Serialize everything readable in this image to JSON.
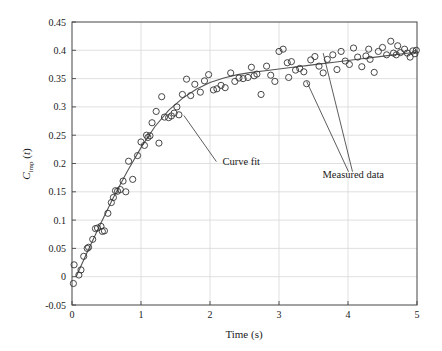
{
  "chart_data": {
    "type": "scatter",
    "title": "",
    "xlabel": "Time (s)",
    "ylabel": "C_imp(t)",
    "ylabel_base": "C",
    "ylabel_sub": "imp",
    "ylabel_arg": "(t)",
    "xlim": [
      0,
      5
    ],
    "ylim": [
      -0.05,
      0.45
    ],
    "xticks": [
      0,
      1,
      2,
      3,
      4,
      5
    ],
    "xtick_labels": [
      "0",
      "1",
      "2",
      "3",
      "4",
      "5"
    ],
    "yticks": [
      -0.05,
      0,
      0.05,
      0.1,
      0.15,
      0.2,
      0.25,
      0.3,
      0.35,
      0.4,
      0.45
    ],
    "ytick_labels": [
      "-0.05",
      "0",
      "0.05",
      "0.1",
      "0.15",
      "0.2",
      "0.25",
      "0.3",
      "0.35",
      "0.4",
      "0.45"
    ],
    "grid": true,
    "legend_position": "none",
    "marker": "open-circle",
    "marker_color": "#333333",
    "line_color": "#555555",
    "grid_color": "#d8d8d8",
    "axis_color": "#444444",
    "annotations": [
      {
        "name": "curve-fit",
        "text": "Curve fit",
        "x": 2.18,
        "y": 0.198,
        "point_x": 1.62,
        "point_y": 0.285
      },
      {
        "name": "measured-data",
        "text": "Measured data",
        "x": 3.63,
        "y": 0.175,
        "point_x": 3.4,
        "point_y": 0.345,
        "point2_x": 3.64,
        "point2_y": 0.395
      }
    ],
    "series": [
      {
        "name": "Measured data",
        "type": "scatter",
        "points": [
          [
            0.02,
            -0.012
          ],
          [
            0.03,
            0.021
          ],
          [
            0.1,
            0.003
          ],
          [
            0.13,
            0.012
          ],
          [
            0.17,
            0.036
          ],
          [
            0.22,
            0.05
          ],
          [
            0.24,
            0.052
          ],
          [
            0.3,
            0.066
          ],
          [
            0.34,
            0.085
          ],
          [
            0.37,
            0.086
          ],
          [
            0.42,
            0.089
          ],
          [
            0.44,
            0.08
          ],
          [
            0.47,
            0.081
          ],
          [
            0.52,
            0.112
          ],
          [
            0.57,
            0.131
          ],
          [
            0.6,
            0.14
          ],
          [
            0.63,
            0.152
          ],
          [
            0.66,
            0.151
          ],
          [
            0.7,
            0.154
          ],
          [
            0.74,
            0.169
          ],
          [
            0.82,
            0.204
          ],
          [
            0.88,
            0.172
          ],
          [
            0.95,
            0.214
          ],
          [
            1.0,
            0.238
          ],
          [
            1.05,
            0.232
          ],
          [
            1.08,
            0.25
          ],
          [
            1.1,
            0.246
          ],
          [
            1.13,
            0.249
          ],
          [
            1.16,
            0.272
          ],
          [
            1.22,
            0.292
          ],
          [
            1.3,
            0.318
          ],
          [
            1.34,
            0.282
          ],
          [
            1.4,
            0.281
          ],
          [
            1.44,
            0.284
          ],
          [
            1.48,
            0.289
          ],
          [
            1.52,
            0.3
          ],
          [
            1.6,
            0.322
          ],
          [
            1.66,
            0.349
          ],
          [
            1.72,
            0.32
          ],
          [
            1.78,
            0.34
          ],
          [
            1.86,
            0.326
          ],
          [
            1.92,
            0.346
          ],
          [
            1.98,
            0.357
          ],
          [
            2.05,
            0.33
          ],
          [
            2.1,
            0.332
          ],
          [
            2.16,
            0.338
          ],
          [
            2.22,
            0.334
          ],
          [
            2.3,
            0.36
          ],
          [
            2.36,
            0.345
          ],
          [
            2.42,
            0.351
          ],
          [
            2.48,
            0.35
          ],
          [
            2.55,
            0.352
          ],
          [
            2.6,
            0.37
          ],
          [
            2.68,
            0.358
          ],
          [
            2.74,
            0.322
          ],
          [
            2.82,
            0.372
          ],
          [
            2.88,
            0.356
          ],
          [
            2.94,
            0.345
          ],
          [
            3.0,
            0.398
          ],
          [
            3.06,
            0.402
          ],
          [
            3.12,
            0.378
          ],
          [
            3.18,
            0.38
          ],
          [
            3.24,
            0.365
          ],
          [
            3.3,
            0.368
          ],
          [
            3.36,
            0.362
          ],
          [
            3.4,
            0.341
          ],
          [
            3.46,
            0.383
          ],
          [
            3.52,
            0.389
          ],
          [
            3.58,
            0.372
          ],
          [
            3.64,
            0.36
          ],
          [
            3.7,
            0.384
          ],
          [
            3.78,
            0.392
          ],
          [
            3.84,
            0.366
          ],
          [
            3.9,
            0.398
          ],
          [
            3.96,
            0.381
          ],
          [
            4.02,
            0.375
          ],
          [
            4.08,
            0.404
          ],
          [
            4.14,
            0.388
          ],
          [
            4.2,
            0.371
          ],
          [
            4.26,
            0.39
          ],
          [
            4.32,
            0.384
          ],
          [
            4.38,
            0.361
          ],
          [
            4.44,
            0.398
          ],
          [
            4.5,
            0.405
          ],
          [
            4.56,
            0.392
          ],
          [
            4.62,
            0.416
          ],
          [
            4.66,
            0.395
          ],
          [
            4.7,
            0.392
          ],
          [
            4.76,
            0.396
          ],
          [
            4.82,
            0.402
          ],
          [
            4.86,
            0.395
          ],
          [
            4.9,
            0.388
          ],
          [
            4.94,
            0.399
          ],
          [
            4.97,
            0.394
          ],
          [
            4.99,
            0.4
          ],
          [
            0.78,
            0.15
          ],
          [
            1.26,
            0.236
          ],
          [
            1.55,
            0.286
          ],
          [
            2.64,
            0.355
          ],
          [
            3.14,
            0.352
          ],
          [
            4.3,
            0.402
          ],
          [
            4.72,
            0.408
          ]
        ]
      },
      {
        "name": "Curve fit",
        "type": "line",
        "points": [
          [
            0.06,
            0.0
          ],
          [
            0.2,
            0.038
          ],
          [
            0.4,
            0.09
          ],
          [
            0.6,
            0.14
          ],
          [
            0.8,
            0.186
          ],
          [
            1.0,
            0.228
          ],
          [
            1.2,
            0.265
          ],
          [
            1.4,
            0.294
          ],
          [
            1.6,
            0.315
          ],
          [
            1.8,
            0.331
          ],
          [
            2.0,
            0.343
          ],
          [
            2.2,
            0.351
          ],
          [
            2.4,
            0.357
          ],
          [
            2.6,
            0.361
          ],
          [
            2.8,
            0.364
          ],
          [
            3.0,
            0.367
          ],
          [
            3.2,
            0.37
          ],
          [
            3.4,
            0.373
          ],
          [
            3.6,
            0.376
          ],
          [
            3.8,
            0.379
          ],
          [
            4.0,
            0.382
          ],
          [
            4.2,
            0.385
          ],
          [
            4.4,
            0.388
          ],
          [
            4.6,
            0.391
          ],
          [
            4.8,
            0.394
          ],
          [
            5.0,
            0.397
          ]
        ]
      }
    ]
  }
}
